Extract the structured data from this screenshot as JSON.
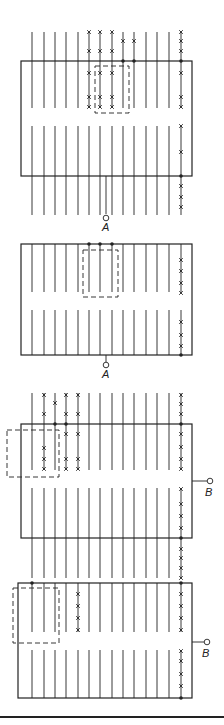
{
  "diagram": {
    "colors": {
      "stroke": "#222222",
      "background": "#ffffff"
    },
    "line_x": [
      32,
      44,
      55,
      66,
      78,
      89,
      100,
      112,
      123,
      134,
      146,
      157,
      169,
      181
    ],
    "panels": [
      {
        "id": "panel-1",
        "terminal_label": "A",
        "terminal_side": "bottom",
        "rect": {
          "x": 21,
          "y": 61,
          "w": 171,
          "h": 115
        },
        "upper": {
          "y1": 32,
          "y2": 108
        },
        "lower": {
          "y1": 126,
          "y2": 215
        },
        "dashed_box": {
          "x": 95,
          "y": 66,
          "w": 34,
          "h": 47
        },
        "terminal": {
          "x": 106,
          "y_line_end": 214,
          "cy": 218,
          "label_y": 231
        }
      },
      {
        "id": "panel-2",
        "terminal_label": "A",
        "terminal_side": "bottom",
        "rect": {
          "x": 21,
          "y": 244,
          "w": 171,
          "h": 111
        },
        "upper": {
          "y1": 244,
          "y2": 292
        },
        "lower": {
          "y1": 310,
          "y2": 355
        },
        "dashed_box": {
          "x": 83,
          "y": 250,
          "w": 35,
          "h": 47
        },
        "terminal": {
          "x": 106,
          "y_line_end": 362,
          "cy": 365,
          "label_y": 378
        }
      },
      {
        "id": "panel-3",
        "terminal_label": "B",
        "terminal_side": "right",
        "rect": {
          "x": 21,
          "y": 424,
          "w": 171,
          "h": 114
        },
        "upper": {
          "y1": 393,
          "y2": 470
        },
        "lower": {
          "y1": 488,
          "y2": 578
        },
        "dashed_box": {
          "x": 7,
          "y": 430,
          "w": 52,
          "h": 47
        },
        "terminal": {
          "y": 481,
          "x_line_end": 207,
          "cx": 210,
          "label_x": 205,
          "label_y": 496
        }
      },
      {
        "id": "panel-4",
        "terminal_label": "B",
        "terminal_side": "right",
        "rect": {
          "x": 18,
          "y": 583,
          "w": 174,
          "h": 115
        },
        "upper": {
          "y1": 583,
          "y2": 632
        },
        "lower": {
          "y1": 650,
          "y2": 698
        },
        "dashed_box": {
          "x": 13,
          "y": 588,
          "w": 46,
          "h": 55
        },
        "terminal": {
          "y": 642,
          "x_line_end": 204,
          "cx": 207,
          "label_x": 202,
          "label_y": 657
        }
      }
    ],
    "bottom_rule_y": 717
  }
}
